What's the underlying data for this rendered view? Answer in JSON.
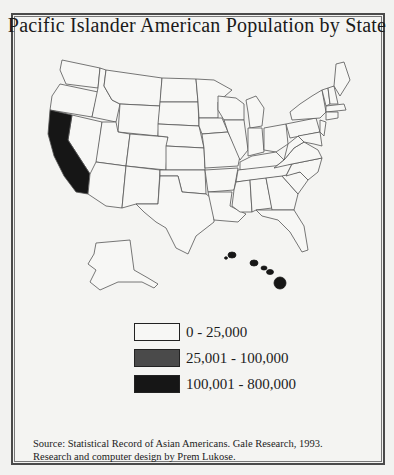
{
  "title": "Pacific Islander American Population by State",
  "legend": {
    "items": [
      {
        "label": "0 - 25,000",
        "color": "#f7f7f5"
      },
      {
        "label": "25,001 - 100,000",
        "color": "#4a4a4a"
      },
      {
        "label": "100,001 - 800,000",
        "color": "#161616"
      }
    ]
  },
  "map": {
    "highlighted_states": [
      {
        "state": "California",
        "category": "100,001 - 800,000",
        "color": "#161616"
      },
      {
        "state": "Hawaii",
        "category": "100,001 - 800,000",
        "color": "#161616"
      }
    ],
    "default_color": "#f7f7f5",
    "stroke_color": "#555555"
  },
  "source": {
    "line1": "Source: Statistical Record of Asian Americans. Gale Research, 1993.",
    "line2": "Research and computer design by Prem Lukose."
  }
}
